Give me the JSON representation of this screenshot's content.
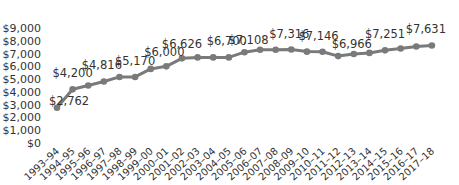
{
  "chart_data": {
    "type": "line",
    "title": "",
    "xlabel": "",
    "ylabel": "",
    "ylim": [
      0,
      9000
    ],
    "yticks": [
      "$0",
      "$1,000",
      "$2,000",
      "$3,000",
      "$4,000",
      "$5,000",
      "$6,000",
      "$7,000",
      "$8,000",
      "$9,000"
    ],
    "grid": false,
    "legend": "none",
    "categories": [
      "1993–94",
      "1994–95",
      "1995–96",
      "1996–97",
      "1997–98",
      "1998–99",
      "1999–00",
      "2000–01",
      "2001–02",
      "2002–03",
      "2003–04",
      "2004–05",
      "2005–06",
      "2006–07",
      "2007–08",
      "2008–09",
      "2009–10",
      "2010–11",
      "2011–12",
      "2012–13",
      "2013–14",
      "2014–15",
      "2015–16",
      "2016–17",
      "2017–18"
    ],
    "series": [
      {
        "name": "Value",
        "color": "#7a7a7a",
        "values": [
          2762,
          4200,
          4500,
          4816,
          5170,
          5170,
          5800,
          6000,
          6626,
          6700,
          6700,
          6700,
          7108,
          7300,
          7300,
          7316,
          7150,
          7146,
          6800,
          6966,
          7050,
          7251,
          7400,
          7550,
          7631
        ]
      }
    ],
    "annotations": [
      {
        "index": 0,
        "label": "$2,762"
      },
      {
        "index": 1,
        "label": "$4,200"
      },
      {
        "index": 3,
        "label": "$4,816"
      },
      {
        "index": 5,
        "label": "$5,170"
      },
      {
        "index": 7,
        "label": "$6,000"
      },
      {
        "index": 8,
        "label": "$6,626"
      },
      {
        "index": 11,
        "label": "$6,700"
      },
      {
        "index": 12,
        "label": "$7,108"
      },
      {
        "index": 15,
        "label": "$7,316"
      },
      {
        "index": 17,
        "label": "$7,146"
      },
      {
        "index": 19,
        "label": "$6,966"
      },
      {
        "index": 21,
        "label": "$7,251"
      },
      {
        "index": 24,
        "label": "$7,631"
      }
    ]
  }
}
